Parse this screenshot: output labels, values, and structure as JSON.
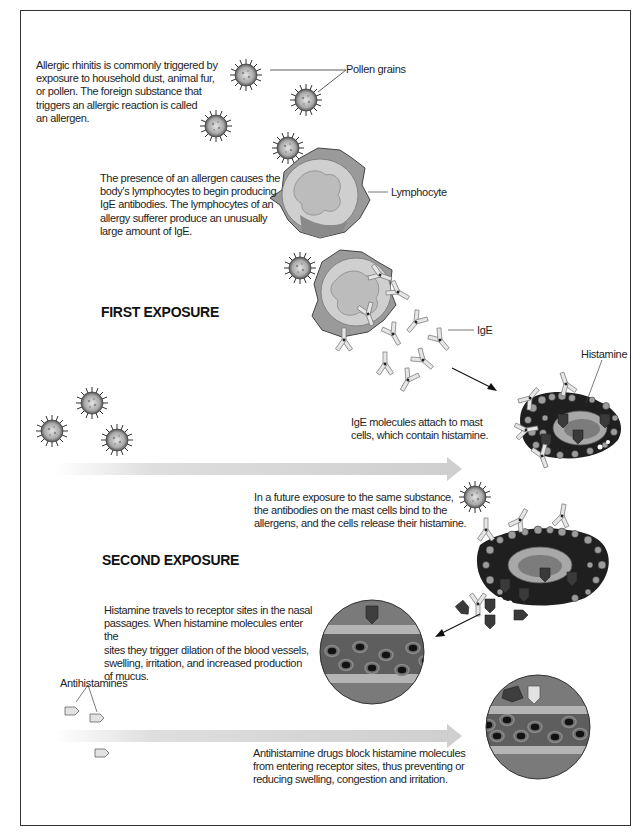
{
  "figure": {
    "sections": {
      "first_exposure": {
        "heading": "FIRST EXPOSURE"
      },
      "second_exposure": {
        "heading": "SECOND EXPOSURE"
      }
    },
    "paragraphs": {
      "allergen": [
        "Allergic rhinitis is commonly triggered by",
        "exposure to household dust, animal fur,",
        "or pollen. The foreign substance that",
        "triggers an allergic reaction is called",
        "an allergen."
      ],
      "lymphocytes": [
        "The presence of an allergen causes the",
        "body's lymphocytes to begin producing",
        "IgE antibodies. The lymphocytes of an",
        "allergy sufferer produce an unusually",
        "large amount of IgE."
      ],
      "mast_cells": [
        "IgE molecules attach to mast",
        "cells, which contain histamine."
      ],
      "future_exposure": [
        "In a future exposure to the same substance,",
        "the antibodies on the mast cells bind to the",
        "allergens, and the cells release their histamine."
      ],
      "histamine_travel": [
        "Histamine travels to receptor sites in the nasal",
        "passages. When histamine molecules enter the",
        "sites they trigger dilation of the blood vessels,",
        "swelling, irritation, and increased production",
        "of mucus."
      ],
      "antihistamine_action": [
        "Antihistamine drugs block histamine molecules",
        "from entering receptor sites, thus preventing or",
        "reducing swelling, congestion and irritation."
      ]
    },
    "labels": {
      "pollen": "Pollen grains",
      "lymphocyte": "Lymphocyte",
      "ige": "IgE",
      "histamine": "Histamine",
      "antihistamines": "Antihistamines"
    },
    "colors": {
      "border": "#333333",
      "arrow_band": "#d4d4d4",
      "cell_body": "#9a9a9a",
      "cell_inner": "#cfcfcf",
      "mast_dark": "#1f1f1f",
      "receptor_fill": "#7a7a7a",
      "receptor_band_light": "#b4b4b4",
      "receptor_band_dark": "#5e5e5e",
      "histamine": "#3a3a3a",
      "antihistamine": "#e2e2e2"
    }
  }
}
